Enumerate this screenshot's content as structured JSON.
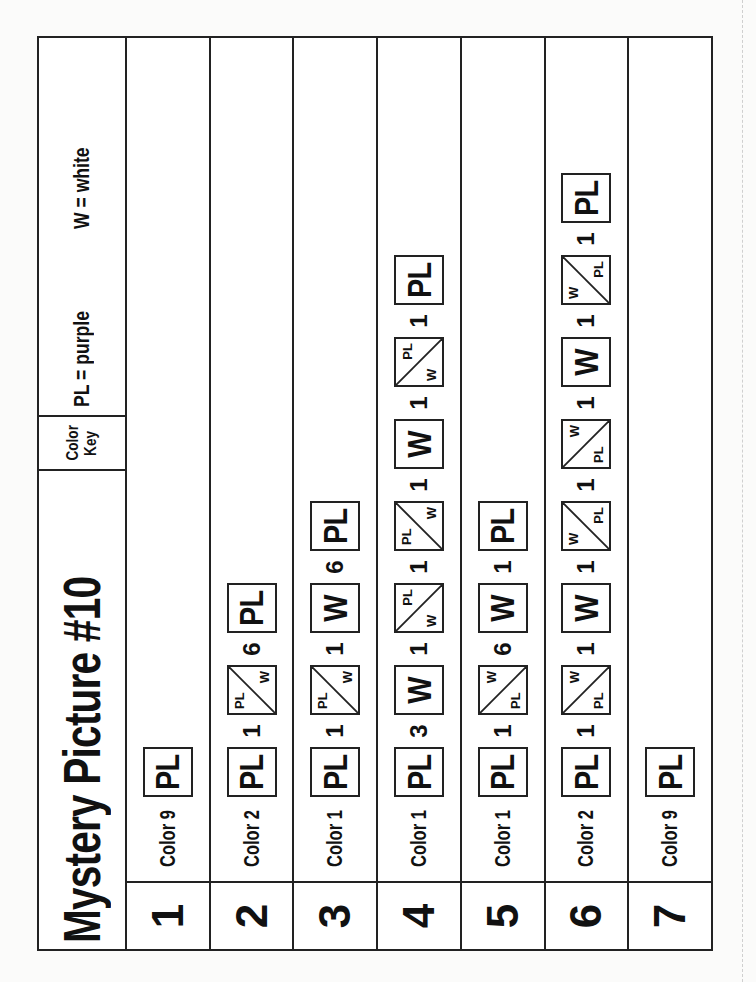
{
  "worksheet": {
    "title": "Mystery Picture #10",
    "color_key": {
      "label_line1": "Color",
      "label_line2": "Key",
      "entries": [
        {
          "code": "PL",
          "text": "PL = purple",
          "color": "#7b3fa0"
        },
        {
          "code": "W",
          "text": "W = white",
          "color": "#ffffff"
        }
      ]
    },
    "rows": [
      {
        "number": "1",
        "start": "Color 9",
        "sequence": [
          {
            "type": "tile",
            "kind": "solid",
            "label": "PL"
          }
        ]
      },
      {
        "number": "2",
        "start": "Color 2",
        "sequence": [
          {
            "type": "tile",
            "kind": "solid",
            "label": "PL"
          },
          {
            "type": "count",
            "value": "1"
          },
          {
            "type": "tile",
            "kind": "split",
            "diag": "d2",
            "a": "PL",
            "b": "W"
          },
          {
            "type": "count",
            "value": "6"
          },
          {
            "type": "tile",
            "kind": "solid",
            "label": "PL"
          }
        ]
      },
      {
        "number": "3",
        "start": "Color 1",
        "sequence": [
          {
            "type": "tile",
            "kind": "solid",
            "label": "PL"
          },
          {
            "type": "count",
            "value": "1"
          },
          {
            "type": "tile",
            "kind": "split",
            "diag": "d2",
            "a": "PL",
            "b": "W"
          },
          {
            "type": "count",
            "value": "1"
          },
          {
            "type": "tile",
            "kind": "solid",
            "label": "W"
          },
          {
            "type": "count",
            "value": "6"
          },
          {
            "type": "tile",
            "kind": "solid",
            "label": "PL"
          }
        ]
      },
      {
        "number": "4",
        "start": "Color 1",
        "sequence": [
          {
            "type": "tile",
            "kind": "solid",
            "label": "PL"
          },
          {
            "type": "count",
            "value": "3"
          },
          {
            "type": "tile",
            "kind": "solid",
            "label": "W"
          },
          {
            "type": "count",
            "value": "1"
          },
          {
            "type": "tile",
            "kind": "split",
            "diag": "d1",
            "a": "W",
            "b": "PL"
          },
          {
            "type": "count",
            "value": "1"
          },
          {
            "type": "tile",
            "kind": "split",
            "diag": "d2",
            "a": "PL",
            "b": "W"
          },
          {
            "type": "count",
            "value": "1"
          },
          {
            "type": "tile",
            "kind": "solid",
            "label": "W"
          },
          {
            "type": "count",
            "value": "1"
          },
          {
            "type": "tile",
            "kind": "split",
            "diag": "d1",
            "a": "W",
            "b": "PL"
          },
          {
            "type": "count",
            "value": "1"
          },
          {
            "type": "tile",
            "kind": "solid",
            "label": "PL"
          }
        ]
      },
      {
        "number": "5",
        "start": "Color 1",
        "sequence": [
          {
            "type": "tile",
            "kind": "solid",
            "label": "PL"
          },
          {
            "type": "count",
            "value": "1"
          },
          {
            "type": "tile",
            "kind": "split",
            "diag": "d1",
            "a": "PL",
            "b": "W"
          },
          {
            "type": "count",
            "value": "6"
          },
          {
            "type": "tile",
            "kind": "solid",
            "label": "W"
          },
          {
            "type": "count",
            "value": "1"
          },
          {
            "type": "tile",
            "kind": "solid",
            "label": "PL"
          }
        ]
      },
      {
        "number": "6",
        "start": "Color 2",
        "sequence": [
          {
            "type": "tile",
            "kind": "solid",
            "label": "PL"
          },
          {
            "type": "count",
            "value": "1"
          },
          {
            "type": "tile",
            "kind": "split",
            "diag": "d1",
            "a": "PL",
            "b": "W"
          },
          {
            "type": "count",
            "value": "1"
          },
          {
            "type": "tile",
            "kind": "solid",
            "label": "W"
          },
          {
            "type": "count",
            "value": "1"
          },
          {
            "type": "tile",
            "kind": "split",
            "diag": "d2",
            "a": "W",
            "b": "PL"
          },
          {
            "type": "count",
            "value": "1"
          },
          {
            "type": "tile",
            "kind": "split",
            "diag": "d1",
            "a": "PL",
            "b": "W"
          },
          {
            "type": "count",
            "value": "1"
          },
          {
            "type": "tile",
            "kind": "solid",
            "label": "W"
          },
          {
            "type": "count",
            "value": "1"
          },
          {
            "type": "tile",
            "kind": "split",
            "diag": "d2",
            "a": "W",
            "b": "PL"
          },
          {
            "type": "count",
            "value": "1"
          },
          {
            "type": "tile",
            "kind": "solid",
            "label": "PL"
          }
        ]
      },
      {
        "number": "7",
        "start": "Color 9",
        "sequence": [
          {
            "type": "tile",
            "kind": "solid",
            "label": "PL"
          }
        ]
      }
    ]
  }
}
